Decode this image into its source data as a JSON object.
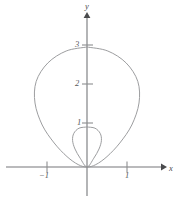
{
  "figure": {
    "background_color": "#ffffff",
    "axis_color": "#76777a",
    "curve_color": "#97989a",
    "label_color": "#57585a",
    "x_axis_label": "x",
    "y_axis_label": "y"
  },
  "axes": {
    "x_ticks": [
      {
        "value": -1,
        "label": "−1"
      },
      {
        "value": 1,
        "label": "1"
      }
    ],
    "y_ticks": [
      {
        "value": 1,
        "label": "1"
      },
      {
        "value": 2,
        "label": "2"
      },
      {
        "value": 3,
        "label": "3"
      }
    ]
  },
  "chart_data": {
    "type": "line",
    "title": "",
    "xlabel": "x",
    "ylabel": "y",
    "coordinate_system": "polar",
    "grid": false,
    "legend": "none",
    "xlim": [
      -2.1,
      2.1
    ],
    "ylim": [
      -0.6,
      3.6
    ],
    "xtick_labels": [
      "−1",
      "1"
    ],
    "xtick_values": [
      -1,
      1
    ],
    "ytick_labels": [
      "1",
      "2",
      "3"
    ],
    "ytick_values": [
      1,
      2,
      3
    ],
    "annotations": [],
    "series": [
      {
        "name": "outer-loop",
        "description": "Outer loop of limacon r = 1 + 2 sin(theta)",
        "equation": "r = 1 + 2 sin(θ)",
        "key_points": [
          {
            "x": 0,
            "y": 3
          },
          {
            "x": -1.3,
            "y": 1.5
          },
          {
            "x": 1.3,
            "y": 1.5
          },
          {
            "x": -1,
            "y": 0
          },
          {
            "x": 1,
            "y": 0
          },
          {
            "x": 0,
            "y": 0
          }
        ],
        "x": [
          0,
          0.52,
          0.98,
          1.27,
          1.3,
          1.12,
          0.82,
          0.5,
          0.22,
          0,
          -0.22,
          -0.5,
          -0.82,
          -1.12,
          -1.3,
          -1.27,
          -0.98,
          -0.52,
          0
        ],
        "y": [
          3,
          2.9,
          2.6,
          2.14,
          1.6,
          1.05,
          0.6,
          0.26,
          0.06,
          0,
          0.06,
          0.26,
          0.6,
          1.05,
          1.6,
          2.14,
          2.6,
          2.9,
          3
        ]
      },
      {
        "name": "inner-loop",
        "description": "Inner loop of limacon r = 1 + 2 sin(theta)",
        "equation": "r = 1 + 2 sin(θ)",
        "key_points": [
          {
            "x": 0,
            "y": 1
          },
          {
            "x": -0.35,
            "y": 0.5
          },
          {
            "x": 0.35,
            "y": 0.5
          },
          {
            "x": 0,
            "y": 0
          }
        ],
        "x": [
          0,
          0.2,
          0.33,
          0.36,
          0.3,
          0.17,
          0,
          -0.17,
          -0.3,
          -0.36,
          -0.33,
          -0.2,
          0
        ],
        "y": [
          1,
          0.97,
          0.84,
          0.66,
          0.45,
          0.22,
          0,
          0.22,
          0.45,
          0.66,
          0.84,
          0.97,
          1
        ]
      }
    ]
  }
}
